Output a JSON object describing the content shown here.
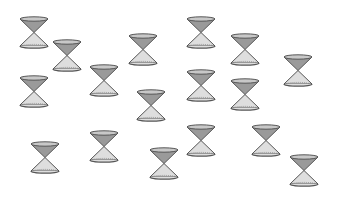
{
  "scene": {
    "description": "Scattered double cones (hourglass shapes) on white background",
    "count": 18,
    "colors": {
      "background": "#ffffff",
      "upper_cone": "#9a9a9a",
      "lower_cone": "#dedede",
      "rim": "#555555",
      "rim_fill": "#c8c8c8"
    },
    "cones": [
      {
        "x": 19,
        "y": 16
      },
      {
        "x": 52,
        "y": 39
      },
      {
        "x": 19,
        "y": 75
      },
      {
        "x": 89,
        "y": 64
      },
      {
        "x": 128,
        "y": 33
      },
      {
        "x": 186,
        "y": 16
      },
      {
        "x": 186,
        "y": 69
      },
      {
        "x": 136,
        "y": 89
      },
      {
        "x": 230,
        "y": 33
      },
      {
        "x": 283,
        "y": 54
      },
      {
        "x": 230,
        "y": 78
      },
      {
        "x": 30,
        "y": 141
      },
      {
        "x": 89,
        "y": 130
      },
      {
        "x": 149,
        "y": 147
      },
      {
        "x": 186,
        "y": 124
      },
      {
        "x": 251,
        "y": 124
      },
      {
        "x": 289,
        "y": 154
      }
    ]
  }
}
